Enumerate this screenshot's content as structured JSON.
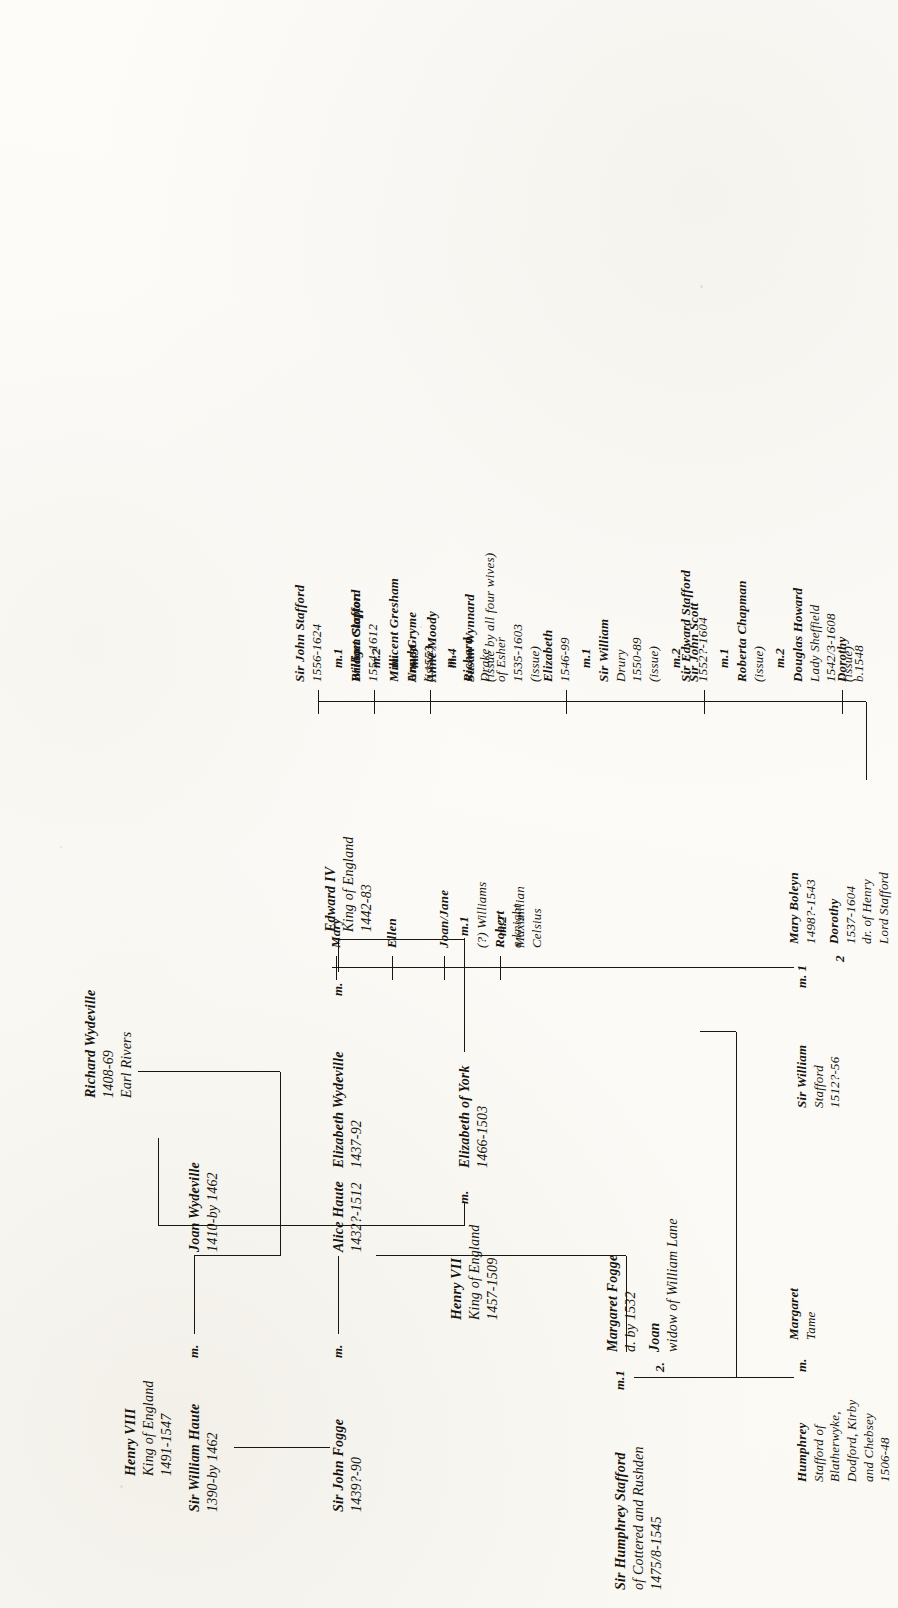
{
  "document": {
    "kind": "genealogical-chart",
    "title": "Stafford / Haute / Wydeville descent chart",
    "orientation": "landscape-page-scanned-rotated-90ccw"
  },
  "nodes": {
    "sir_william_haute": {
      "lines": [
        "Sir William Haute",
        "1390-by 1462"
      ]
    },
    "joan_wydeville": {
      "lines": [
        "Joan Wydeville",
        "1410-by 1462"
      ]
    },
    "richard_wydeville": {
      "lines": [
        "Richard Wydeville",
        "1408-69",
        "Earl Rivers"
      ]
    },
    "sir_john_fogge": {
      "lines": [
        "Sir John Fogge",
        "1439?-90"
      ]
    },
    "alice_haute": {
      "lines": [
        "Alice Haute",
        "1432?-1512"
      ]
    },
    "elizabeth_wydeville": {
      "lines": [
        "Elizabeth Wydeville",
        "1437-92"
      ]
    },
    "edward_iv": {
      "lines": [
        "Edward IV",
        "King of England",
        "1442-83"
      ]
    },
    "elizabeth_of_york": {
      "lines": [
        "Elizabeth of York",
        "1466-1503"
      ]
    },
    "henry_vii": {
      "lines": [
        "Henry VII",
        "King of England",
        "1457-1509"
      ]
    },
    "henry_viii": {
      "lines": [
        "Henry VIII",
        "King of England",
        "1491-1547"
      ]
    },
    "sir_humphrey_stafford": {
      "lines": [
        "Sir Humphrey Stafford",
        "of Cottered and Rushden",
        "1475/8-1545"
      ]
    },
    "margaret_fogge": {
      "lines": [
        "Margaret Fogge",
        "d. by 1532"
      ]
    },
    "joan_lane": {
      "lines": [
        "Joan",
        "widow of William Lane"
      ]
    },
    "humphrey_stafford_blatherwyke": {
      "lines": [
        "Humphrey",
        "Stafford of",
        "Blatherwyke,",
        "Dodford, Kirby",
        "and Chebsey",
        "1506-48"
      ]
    },
    "margaret_tame": {
      "lines": [
        "Margaret",
        "Tame"
      ]
    },
    "sir_william_stafford": {
      "lines": [
        "Sir William",
        "Stafford",
        "1512?-56"
      ]
    },
    "mary_boleyn": {
      "lines": [
        "Mary Boleyn",
        "1498?-1543"
      ]
    },
    "dorothy_stafford": {
      "lines": [
        "Dorothy",
        "1537-1604",
        "dr. of Henry",
        "Lord Stafford"
      ]
    },
    "robert": {
      "lines": [
        "Robert",
        "a knight"
      ]
    },
    "joan_jane": {
      "lines": [
        "Joan/Jane"
      ]
    },
    "joan_jane_m1": {
      "lines": [
        "(?) Williams"
      ]
    },
    "joan_jane_m2": {
      "lines": [
        "Maximilian",
        "Celsius"
      ]
    },
    "ellen": {
      "lines": [
        "Ellen"
      ]
    },
    "mary": {
      "lines": [
        "Mary"
      ]
    },
    "dorothy_b1548": {
      "lines": [
        "Dorothy",
        "b.1548"
      ]
    },
    "sir_edward_stafford": {
      "lines": [
        "Sir Edward Stafford",
        "1552?-1604"
      ]
    },
    "roberta_chapman": {
      "lines": [
        "Roberta Chapman",
        "(issue)"
      ]
    },
    "douglas_howard": {
      "lines": [
        "Douglas Howard",
        "Lady Sheffield",
        "1542/3-1608",
        "(issue)"
      ]
    },
    "elizabeth_1546": {
      "lines": [
        "Elizabeth",
        "1546-99"
      ]
    },
    "sir_william_drury": {
      "lines": [
        "Sir William",
        "Drury",
        "1550-89",
        "(issue)"
      ]
    },
    "sir_john_scott": {
      "lines": [
        "Sir John Scott"
      ]
    },
    "ursula": {
      "lines": [
        "Ursula",
        "b.1553"
      ]
    },
    "richard_drake": {
      "lines": [
        "Richard",
        "Drake",
        "of Esher",
        "1535-1603",
        "(issue)"
      ]
    },
    "william_stafford_1554": {
      "lines": [
        "William Stafford",
        "1554-1612"
      ]
    },
    "anne_gryme": {
      "lines": [
        "Anne Gryme",
        "(issue)"
      ]
    },
    "sir_john_stafford": {
      "lines": [
        "Sir John Stafford",
        "1556-1624"
      ]
    },
    "bridget_clopton": {
      "lines": [
        "Bridget Clopton"
      ]
    },
    "millicent_gresham": {
      "lines": [
        "Millicent Gresham"
      ]
    },
    "anne_moody": {
      "lines": [
        "Anne Moody"
      ]
    },
    "susan_wynnard": {
      "lines": [
        "Susan Wynnard"
      ]
    },
    "issue_all_four": {
      "lines": [
        "(issue by all four wives)"
      ]
    }
  },
  "markers": {
    "m_haute_joan": "m.",
    "m_fogge_alice": "m.",
    "m_wydeville_edward": "m.",
    "m_henryvii_eliz": "m.",
    "m_humphrey_1": "m.1",
    "m_humphrey_2": "2.",
    "m_humphrey_tame": "m.",
    "m_william_mary": "m. 1",
    "m_william_dorothy": "2",
    "m_joanjane_1": "m.1",
    "m_joanjane_2": "m.2",
    "m_edward_1": "m.1",
    "m_edward_2": "m.2",
    "m_elizabeth_1": "m.1",
    "m_elizabeth_2": "m.2",
    "m_ursula": "m.",
    "m_william1554": "m.",
    "m_john_1": "m.1",
    "m_john_2": "m.2",
    "m_john_3": "m.3",
    "m_john_4": "m.4"
  },
  "colors": {
    "ink": "#17140f",
    "rule": "#1a1713",
    "paper": "#fdfdfb"
  }
}
